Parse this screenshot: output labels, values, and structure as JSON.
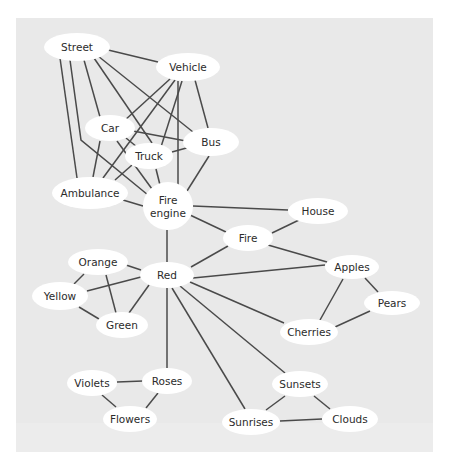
{
  "diagram": {
    "type": "semantic-network",
    "background_color": "#e9e9e9",
    "node_fill": "#ffffff",
    "edge_color": "#4a4a4a",
    "nodes": [
      {
        "id": "street",
        "label": "Street",
        "lines": [
          "Street"
        ],
        "cx": 77,
        "cy": 47,
        "rx": 33,
        "ry": 14
      },
      {
        "id": "vehicle",
        "label": "Vehicle",
        "lines": [
          "Vehicle"
        ],
        "cx": 188,
        "cy": 67,
        "rx": 32,
        "ry": 14
      },
      {
        "id": "car",
        "label": "Car",
        "lines": [
          "Car"
        ],
        "cx": 110,
        "cy": 128,
        "rx": 25,
        "ry": 13
      },
      {
        "id": "bus",
        "label": "Bus",
        "lines": [
          "Bus"
        ],
        "cx": 211,
        "cy": 142,
        "rx": 28,
        "ry": 14
      },
      {
        "id": "truck",
        "label": "Truck",
        "lines": [
          "Truck"
        ],
        "cx": 149,
        "cy": 156,
        "rx": 24,
        "ry": 13
      },
      {
        "id": "ambulance",
        "label": "Ambulance",
        "lines": [
          "Ambulance"
        ],
        "cx": 90,
        "cy": 193,
        "rx": 38,
        "ry": 16
      },
      {
        "id": "fire_engine",
        "label": "Fire engine",
        "lines": [
          "Fire",
          "engine"
        ],
        "cx": 168,
        "cy": 206,
        "rx": 25,
        "ry": 24
      },
      {
        "id": "house",
        "label": "House",
        "lines": [
          "House"
        ],
        "cx": 318,
        "cy": 211,
        "rx": 30,
        "ry": 13
      },
      {
        "id": "fire",
        "label": "Fire",
        "lines": [
          "Fire"
        ],
        "cx": 248,
        "cy": 238,
        "rx": 25,
        "ry": 13
      },
      {
        "id": "red",
        "label": "Red",
        "lines": [
          "Red"
        ],
        "cx": 167,
        "cy": 275,
        "rx": 27,
        "ry": 13
      },
      {
        "id": "orange",
        "label": "Orange",
        "lines": [
          "Orange"
        ],
        "cx": 98,
        "cy": 262,
        "rx": 30,
        "ry": 13
      },
      {
        "id": "apples",
        "label": "Apples",
        "lines": [
          "Apples"
        ],
        "cx": 352,
        "cy": 267,
        "rx": 27,
        "ry": 12
      },
      {
        "id": "yellow",
        "label": "Yellow",
        "lines": [
          "Yellow"
        ],
        "cx": 60,
        "cy": 296,
        "rx": 28,
        "ry": 14
      },
      {
        "id": "pears",
        "label": "Pears",
        "lines": [
          "Pears"
        ],
        "cx": 392,
        "cy": 303,
        "rx": 28,
        "ry": 12
      },
      {
        "id": "green",
        "label": "Green",
        "lines": [
          "Green"
        ],
        "cx": 122,
        "cy": 325,
        "rx": 26,
        "ry": 13
      },
      {
        "id": "cherries",
        "label": "Cherries",
        "lines": [
          "Cherries"
        ],
        "cx": 309,
        "cy": 332,
        "rx": 29,
        "ry": 13
      },
      {
        "id": "roses",
        "label": "Roses",
        "lines": [
          "Roses"
        ],
        "cx": 167,
        "cy": 381,
        "rx": 25,
        "ry": 13
      },
      {
        "id": "violets",
        "label": "Violets",
        "lines": [
          "Violets"
        ],
        "cx": 92,
        "cy": 383,
        "rx": 25,
        "ry": 13
      },
      {
        "id": "sunsets",
        "label": "Sunsets",
        "lines": [
          "Sunsets"
        ],
        "cx": 300,
        "cy": 384,
        "rx": 28,
        "ry": 13
      },
      {
        "id": "flowers",
        "label": "Flowers",
        "lines": [
          "Flowers"
        ],
        "cx": 130,
        "cy": 419,
        "rx": 27,
        "ry": 13
      },
      {
        "id": "clouds",
        "label": "Clouds",
        "lines": [
          "Clouds"
        ],
        "cx": 350,
        "cy": 419,
        "rx": 28,
        "ry": 13
      },
      {
        "id": "sunrises",
        "label": "Sunrises",
        "lines": [
          "Sunrises"
        ],
        "cx": 251,
        "cy": 422,
        "rx": 29,
        "ry": 13
      }
    ],
    "edges": [
      {
        "from": "street",
        "to": "vehicle",
        "points": [
          [
            104,
            49
          ],
          [
            158,
            62
          ]
        ]
      },
      {
        "from": "street",
        "to": "bus",
        "points": [
          [
            98,
            56
          ],
          [
            193,
            132
          ]
        ]
      },
      {
        "from": "street",
        "to": "truck",
        "points": [
          [
            94,
            58
          ],
          [
            152,
            143
          ]
        ]
      },
      {
        "from": "street",
        "to": "car",
        "points": [
          [
            84,
            60
          ],
          [
            100,
            117
          ]
        ]
      },
      {
        "from": "street",
        "to": "ambulance",
        "points": [
          [
            60,
            58
          ],
          [
            77,
            178
          ]
        ]
      },
      {
        "from": "street",
        "to": "fire_engine",
        "points": [
          [
            70,
            60
          ],
          [
            81,
            140
          ],
          [
            148,
            195
          ]
        ]
      },
      {
        "from": "vehicle",
        "to": "car",
        "points": [
          [
            170,
            79
          ],
          [
            124,
            121
          ]
        ]
      },
      {
        "from": "vehicle",
        "to": "ambulance",
        "points": [
          [
            175,
            80
          ],
          [
            103,
            178
          ]
        ]
      },
      {
        "from": "vehicle",
        "to": "truck",
        "points": [
          [
            182,
            81
          ],
          [
            160,
            150
          ]
        ]
      },
      {
        "from": "vehicle",
        "to": "fire_engine",
        "points": [
          [
            178,
            81
          ],
          [
            178,
            185
          ]
        ]
      },
      {
        "from": "vehicle",
        "to": "bus",
        "points": [
          [
            195,
            80
          ],
          [
            208,
            128
          ]
        ]
      },
      {
        "from": "car",
        "to": "bus",
        "points": [
          [
            133,
            131
          ],
          [
            186,
            141
          ]
        ]
      },
      {
        "from": "car",
        "to": "truck",
        "points": [
          [
            126,
            138
          ],
          [
            137,
            147
          ]
        ]
      },
      {
        "from": "car",
        "to": "fire_engine",
        "points": [
          [
            117,
            141
          ],
          [
            152,
            189
          ]
        ]
      },
      {
        "from": "car",
        "to": "ambulance",
        "points": [
          [
            100,
            141
          ],
          [
            93,
            177
          ]
        ]
      },
      {
        "from": "truck",
        "to": "bus",
        "points": [
          [
            172,
            152
          ],
          [
            190,
            147
          ]
        ]
      },
      {
        "from": "truck",
        "to": "fire_engine",
        "points": [
          [
            156,
            169
          ],
          [
            160,
            185
          ]
        ]
      },
      {
        "from": "truck",
        "to": "ambulance",
        "points": [
          [
            132,
            165
          ],
          [
            115,
            180
          ]
        ]
      },
      {
        "from": "bus",
        "to": "fire_engine",
        "points": [
          [
            209,
            156
          ],
          [
            187,
            191
          ]
        ]
      },
      {
        "from": "ambulance",
        "to": "fire_engine",
        "points": [
          [
            123,
            200
          ],
          [
            143,
            206
          ]
        ]
      },
      {
        "from": "fire_engine",
        "to": "house",
        "points": [
          [
            193,
            206
          ],
          [
            288,
            210
          ]
        ]
      },
      {
        "from": "fire_engine",
        "to": "fire",
        "points": [
          [
            190,
            215
          ],
          [
            226,
            232
          ]
        ]
      },
      {
        "from": "fire_engine",
        "to": "red",
        "points": [
          [
            167,
            230
          ],
          [
            167,
            262
          ]
        ]
      },
      {
        "from": "house",
        "to": "fire",
        "points": [
          [
            299,
            220
          ],
          [
            272,
            233
          ]
        ]
      },
      {
        "from": "fire",
        "to": "apples",
        "points": [
          [
            268,
            245
          ],
          [
            327,
            262
          ]
        ]
      },
      {
        "from": "fire",
        "to": "red",
        "points": [
          [
            228,
            246
          ],
          [
            191,
            267
          ]
        ]
      },
      {
        "from": "red",
        "to": "apples",
        "points": [
          [
            193,
            278
          ],
          [
            325,
            265
          ]
        ]
      },
      {
        "from": "red",
        "to": "cherries",
        "points": [
          [
            190,
            282
          ],
          [
            284,
            323
          ]
        ]
      },
      {
        "from": "red",
        "to": "orange",
        "points": [
          [
            141,
            270
          ],
          [
            126,
            265
          ]
        ]
      },
      {
        "from": "red",
        "to": "yellow",
        "points": [
          [
            141,
            277
          ],
          [
            87,
            291
          ]
        ]
      },
      {
        "from": "red",
        "to": "green",
        "points": [
          [
            149,
            285
          ],
          [
            129,
            313
          ]
        ]
      },
      {
        "from": "red",
        "to": "roses",
        "points": [
          [
            167,
            288
          ],
          [
            167,
            368
          ]
        ]
      },
      {
        "from": "red",
        "to": "sunrises",
        "points": [
          [
            172,
            288
          ],
          [
            245,
            409
          ]
        ]
      },
      {
        "from": "red",
        "to": "sunsets",
        "points": [
          [
            180,
            286
          ],
          [
            285,
            373
          ]
        ]
      },
      {
        "from": "orange",
        "to": "yellow",
        "points": [
          [
            84,
            274
          ],
          [
            74,
            284
          ]
        ]
      },
      {
        "from": "orange",
        "to": "green",
        "points": [
          [
            106,
            275
          ],
          [
            116,
            313
          ]
        ]
      },
      {
        "from": "yellow",
        "to": "green",
        "points": [
          [
            79,
            307
          ],
          [
            99,
            319
          ]
        ]
      },
      {
        "from": "apples",
        "to": "pears",
        "points": [
          [
            365,
            278
          ],
          [
            378,
            292
          ]
        ]
      },
      {
        "from": "apples",
        "to": "cherries",
        "points": [
          [
            343,
            279
          ],
          [
            320,
            320
          ]
        ]
      },
      {
        "from": "pears",
        "to": "cherries",
        "points": [
          [
            370,
            311
          ],
          [
            335,
            327
          ]
        ]
      },
      {
        "from": "roses",
        "to": "violets",
        "points": [
          [
            143,
            381
          ],
          [
            117,
            382
          ]
        ]
      },
      {
        "from": "roses",
        "to": "flowers",
        "points": [
          [
            158,
            393
          ],
          [
            146,
            408
          ]
        ]
      },
      {
        "from": "violets",
        "to": "flowers",
        "points": [
          [
            102,
            395
          ],
          [
            116,
            407
          ]
        ]
      },
      {
        "from": "sunsets",
        "to": "sunrises",
        "points": [
          [
            285,
            396
          ],
          [
            266,
            410
          ]
        ]
      },
      {
        "from": "sunsets",
        "to": "clouds",
        "points": [
          [
            314,
            396
          ],
          [
            330,
            409
          ]
        ]
      },
      {
        "from": "sunrises",
        "to": "clouds",
        "points": [
          [
            280,
            421
          ],
          [
            322,
            419
          ]
        ]
      }
    ]
  }
}
